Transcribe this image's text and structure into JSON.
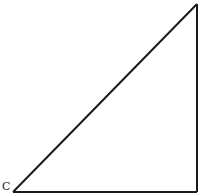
{
  "diagram": {
    "type": "right-triangle",
    "vertices": {
      "C": {
        "x": 13,
        "y": 192
      },
      "top": {
        "x": 197,
        "y": 4
      },
      "right_angle": {
        "x": 197,
        "y": 192
      }
    },
    "labels": [
      {
        "text": "C",
        "x": 3,
        "y": 190
      }
    ],
    "stroke_color": "#1a1a1a",
    "background": "#ffffff"
  }
}
